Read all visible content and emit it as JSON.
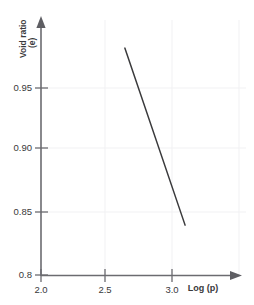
{
  "chart_data": {
    "type": "line",
    "title": "",
    "subtitle": "",
    "xlabel": "Log (p)",
    "ylabel": "Void ratio (e)",
    "ylabel_line1": "Void ratio",
    "ylabel_line2": "(e)",
    "xlim": [
      2.0,
      3.25
    ],
    "ylim": [
      0.8,
      1.0
    ],
    "xticks": [
      2.0,
      2.5,
      3.0
    ],
    "xtick_labels": [
      "2.0",
      "2.5",
      "3.0"
    ],
    "yticks": [
      0.8,
      0.85,
      0.9,
      0.95
    ],
    "ytick_labels": [
      "0.8",
      "0.85",
      "0.90",
      "0.95"
    ],
    "grid": true,
    "grid_color": "#f0f0f2",
    "legend": "none",
    "axis_color": "#6b6b70",
    "line_color": "#3a3a3c",
    "series": [
      {
        "name": "compression line",
        "x": [
          2.64,
          3.1
        ],
        "y": [
          0.982,
          0.84
        ]
      }
    ]
  },
  "axes": {
    "x_arrow": "arrow-right",
    "y_arrow": "arrow-up"
  }
}
